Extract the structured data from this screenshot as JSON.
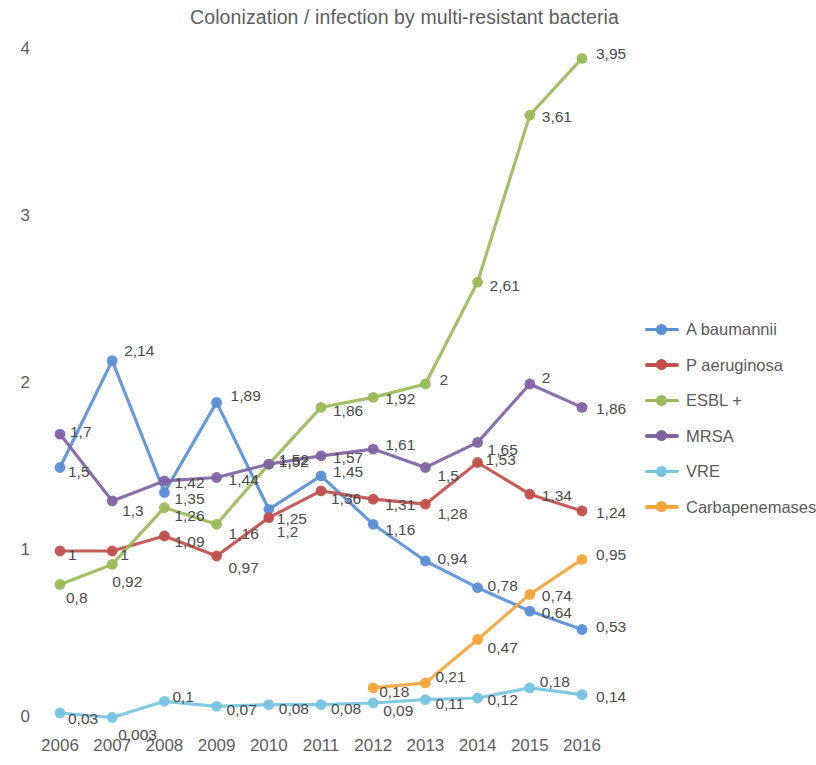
{
  "chart_data": {
    "type": "line",
    "title": "Colonization / infection by multi-resistant bacteria",
    "xlabel": "",
    "ylabel": "",
    "categories": [
      "2006",
      "2007",
      "2008",
      "2009",
      "2010",
      "2011",
      "2012",
      "2013",
      "2014",
      "2015",
      "2016"
    ],
    "yticks": [
      "0",
      "1",
      "2",
      "3",
      "4"
    ],
    "ylim": [
      0,
      4
    ],
    "grid": false,
    "legend_position": "right",
    "decimal_separator": ",",
    "series": [
      {
        "name": "A baumannii",
        "color": "#5B8FD4",
        "values": [
          1.5,
          2.14,
          1.35,
          1.89,
          1.25,
          1.45,
          1.16,
          0.94,
          0.78,
          0.64,
          0.53
        ],
        "labels": [
          "1,5",
          "2,14",
          "1,35",
          "1,89",
          "1,25",
          "1,45",
          "1,16",
          "0,94",
          "0,78",
          "0,64",
          "0,53"
        ]
      },
      {
        "name": "P aeruginosa",
        "color": "#C0504D",
        "values": [
          1,
          1,
          1.09,
          0.97,
          1.2,
          1.36,
          1.31,
          1.28,
          1.53,
          1.34,
          1.24
        ],
        "labels": [
          "1",
          "1",
          "1,09",
          "0,97",
          "1,2",
          "1,36",
          "1,31",
          "1,28",
          "1,53",
          "1,34",
          "1,24"
        ]
      },
      {
        "name": "ESBL +",
        "color": "#9BBB59",
        "values": [
          0.8,
          0.92,
          1.26,
          1.16,
          1.52,
          1.86,
          1.92,
          2,
          2.61,
          3.61,
          3.95
        ],
        "labels": [
          "0,8",
          "0,92",
          "1,26",
          "1,16",
          "1,52",
          "1,86",
          "1,92",
          "2",
          "2,61",
          "3,61",
          "3,95"
        ]
      },
      {
        "name": "MRSA",
        "color": "#8064A2",
        "values": [
          1.7,
          1.3,
          1.42,
          1.44,
          1.52,
          1.57,
          1.61,
          1.5,
          1.65,
          2,
          1.86
        ],
        "labels": [
          "1,7",
          "1,3",
          "1,42",
          "1,44",
          "1,52",
          "1,57",
          "1,61",
          "1,5",
          "1,65",
          "2",
          "1,86"
        ]
      },
      {
        "name": "VRE",
        "color": "#77C4E0",
        "values": [
          0.03,
          0.003,
          0.1,
          0.07,
          0.08,
          0.08,
          0.09,
          0.11,
          0.12,
          0.18,
          0.14
        ],
        "labels": [
          "0,03",
          "0,003",
          "0,1",
          "0,07",
          "0,08",
          "0,08",
          "0,09",
          "0,11",
          "0,12",
          "0,18",
          "0,14"
        ]
      },
      {
        "name": "Carbapenemases",
        "color": "#F4A63C",
        "values": [
          null,
          null,
          null,
          null,
          null,
          null,
          0.18,
          0.21,
          0.47,
          0.74,
          0.95
        ],
        "labels": [
          "",
          "",
          "",
          "",
          "",
          "",
          "0,18",
          "0,21",
          "0,47",
          "0,74",
          "0,95"
        ]
      }
    ]
  }
}
